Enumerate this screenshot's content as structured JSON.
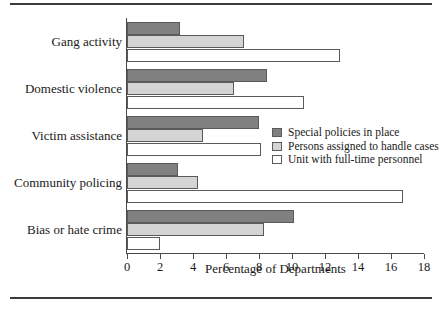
{
  "chart_data": {
    "type": "bar",
    "orientation": "horizontal",
    "title": "",
    "xlabel": "Percentage of Departments",
    "ylabel": "",
    "xlim": [
      0,
      18
    ],
    "xticks": [
      0,
      2,
      4,
      6,
      8,
      10,
      12,
      14,
      16,
      18
    ],
    "grid": false,
    "legend_position": "inside-right",
    "categories": [
      "Gang activity",
      "Domestic violence",
      "Victim assistance",
      "Community policing",
      "Bias or hate crime"
    ],
    "series": [
      {
        "name": "Special policies in place",
        "color": "#808080",
        "values": [
          3.2,
          8.5,
          8.0,
          3.1,
          10.1
        ]
      },
      {
        "name": "Persons assigned to handle cases",
        "color": "#d4d4d4",
        "values": [
          7.1,
          6.5,
          4.6,
          4.3,
          8.3
        ]
      },
      {
        "name": "Unit with full-time personnel",
        "color": "#ffffff",
        "values": [
          12.9,
          10.7,
          8.1,
          16.7,
          2.0
        ]
      }
    ]
  }
}
